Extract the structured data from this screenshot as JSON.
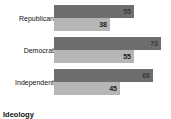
{
  "chart_data": {
    "type": "bar",
    "orientation": "horizontal",
    "title": "",
    "xlabel": "",
    "ylabel": "Ideology",
    "categories": [
      "Republican",
      "Democrat",
      "Independent"
    ],
    "series": [
      {
        "name": "dark",
        "values": [
          55,
          73,
          68
        ]
      },
      {
        "name": "light",
        "values": [
          38,
          55,
          45
        ]
      }
    ],
    "xlim": [
      0,
      80
    ],
    "grid": false,
    "legend": "none",
    "colors": {
      "dark_bar": "#6e6e6e",
      "light_bar": "#b6b6b6",
      "background": "#ffffff",
      "text": "#111111"
    }
  },
  "axis": {
    "y_title": "Ideology"
  },
  "groups": [
    {
      "label": "Republican",
      "bars": [
        {
          "value": 55,
          "value_text": "55",
          "style": "dark"
        },
        {
          "value": 38,
          "value_text": "38",
          "style": "light"
        }
      ]
    },
    {
      "label": "Democrat",
      "bars": [
        {
          "value": 73,
          "value_text": "73",
          "style": "dark"
        },
        {
          "value": 55,
          "value_text": "55",
          "style": "light"
        }
      ]
    },
    {
      "label": "Independent",
      "bars": [
        {
          "value": 68,
          "value_text": "68",
          "style": "dark"
        },
        {
          "value": 45,
          "value_text": "45",
          "style": "light"
        }
      ]
    }
  ]
}
